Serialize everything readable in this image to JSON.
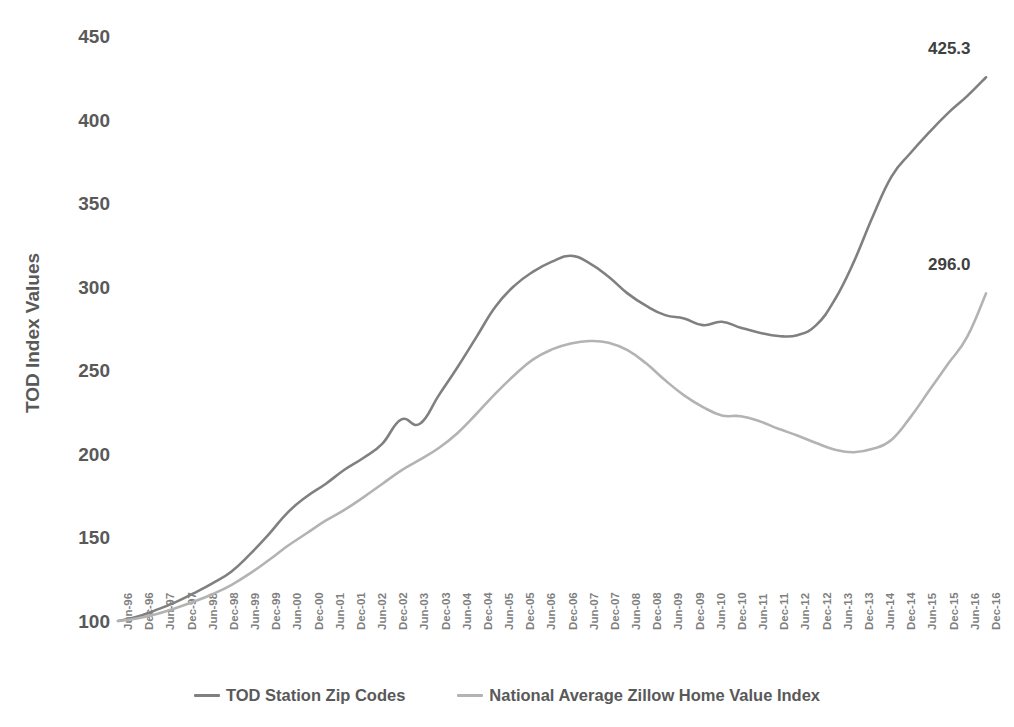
{
  "chart_data": {
    "type": "line",
    "title": "",
    "xlabel": "",
    "ylabel": "TOD Index Values",
    "ylim": [
      100,
      450
    ],
    "yticks": [
      100,
      150,
      200,
      250,
      300,
      350,
      400,
      450
    ],
    "grid": false,
    "legend_position": "bottom",
    "categories": [
      "Jun-96",
      "Dec-96",
      "Jun-97",
      "Dec-97",
      "Jun-98",
      "Dec-98",
      "Jun-99",
      "Dec-99",
      "Jun-00",
      "Dec-00",
      "Jun-01",
      "Dec-01",
      "Jun-02",
      "Dec-02",
      "Jun-03",
      "Dec-03",
      "Jun-04",
      "Dec-04",
      "Jun-05",
      "Dec-05",
      "Jun-06",
      "Dec-06",
      "Jun-07",
      "Dec-07",
      "Jun-08",
      "Dec-08",
      "Jun-09",
      "Dec-09",
      "Jun-10",
      "Dec-10",
      "Jun-11",
      "Dec-11",
      "Jun-12",
      "Dec-12",
      "Jun-13",
      "Dec-13",
      "Jun-14",
      "Dec-14",
      "Jun-15",
      "Dec-15",
      "Jun-16",
      "Dec-16"
    ],
    "series": [
      {
        "name": "TOD Station Zip Codes",
        "color": "#808080",
        "end_label": "425.3",
        "values": [
          100.0,
          102.5,
          106.5,
          111.0,
          116.5,
          122.5,
          129.5,
          140.0,
          152.0,
          165.0,
          174.5,
          182.0,
          190.5,
          197.5,
          206.0,
          220.5,
          218.0,
          235.0,
          252.0,
          270.0,
          288.0,
          300.5,
          309.0,
          315.0,
          318.5,
          314.0,
          306.0,
          296.0,
          288.5,
          283.0,
          281.0,
          277.0,
          279.0,
          275.5,
          272.5,
          270.5,
          271.0,
          277.0,
          292.5,
          315.0,
          342.0,
          366.0
        ]
      },
      {
        "name": "National Average Zillow Home Value Index",
        "color": "#b3b3b3",
        "end_label": "296.0",
        "values": [
          100.0,
          101.5,
          104.0,
          107.5,
          111.5,
          116.0,
          121.5,
          128.5,
          136.5,
          145.0,
          152.5,
          160.0,
          166.5,
          174.0,
          182.0,
          190.0,
          196.5,
          203.5,
          212.5,
          224.0,
          236.0,
          247.0,
          256.5,
          262.5,
          266.0,
          267.5,
          266.5,
          262.0,
          254.0,
          244.0,
          235.0,
          228.0,
          223.0,
          222.5,
          219.5,
          215.0,
          211.0,
          206.5,
          202.5,
          201.0,
          203.0,
          208.5
        ]
      }
    ],
    "series_tail": [
      {
        "name": "TOD Station Zip Codes",
        "note": "final segment values continue to end label 425.3",
        "values": [
          366.0,
          380.0,
          392.5,
          404.0,
          414.0,
          425.3
        ]
      },
      {
        "name": "National Average Zillow Home Value Index",
        "note": "final segment values continue to end label 296.0",
        "values": [
          208.5,
          222.0,
          238.0,
          254.0,
          270.0,
          296.0
        ]
      }
    ],
    "annotations": [
      {
        "text": "425.3",
        "series": "TOD Station Zip Codes",
        "at": "Dec-16"
      },
      {
        "text": "296.0",
        "series": "National Average Zillow Home Value Index",
        "at": "Dec-16"
      }
    ]
  },
  "legend": {
    "items": [
      {
        "label": "TOD Station Zip Codes",
        "color": "#808080"
      },
      {
        "label": "National Average Zillow Home Value Index",
        "color": "#b3b3b3"
      }
    ]
  },
  "axis": {
    "y_title": "TOD Index Values"
  }
}
